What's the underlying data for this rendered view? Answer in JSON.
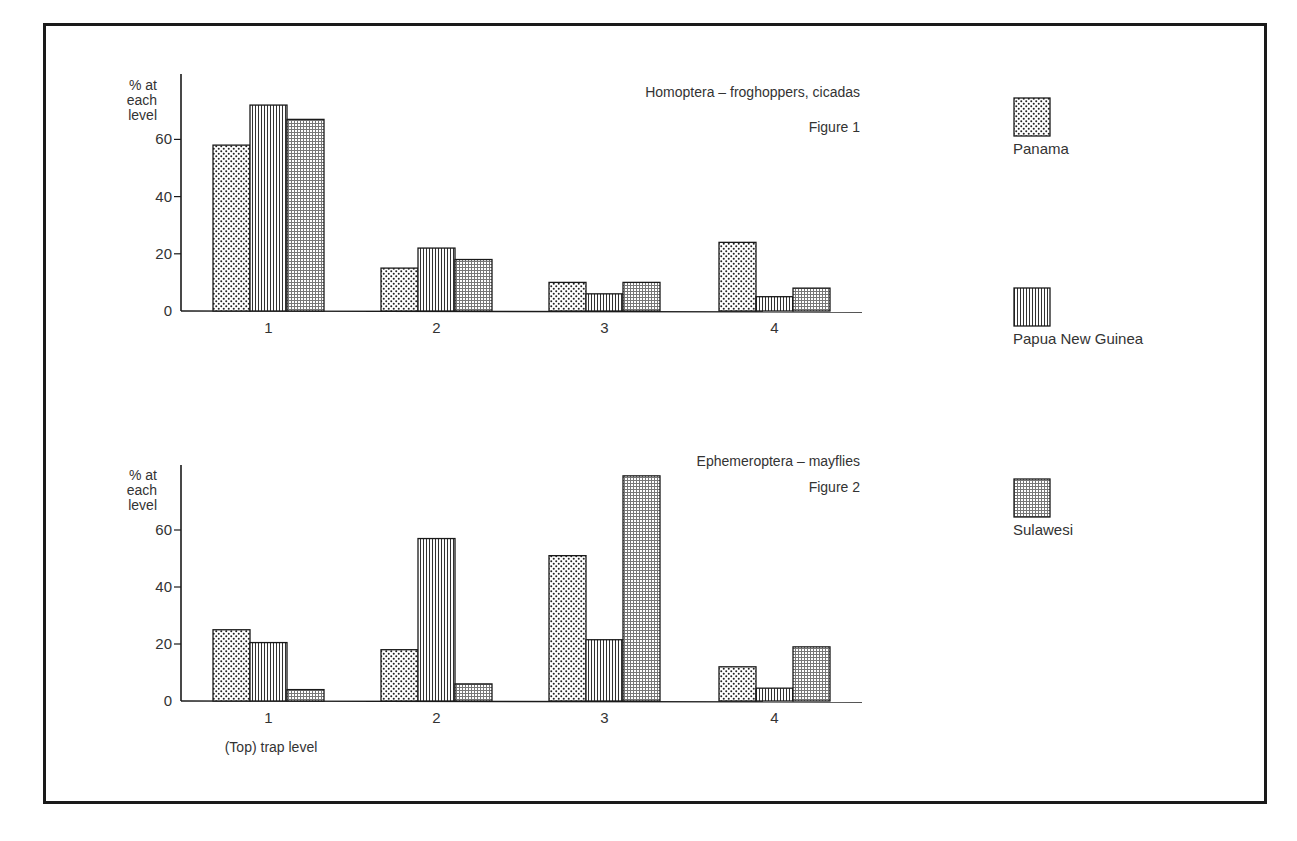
{
  "chart_data": [
    {
      "type": "bar",
      "title": "Homoptera – froghoppers, cicadas",
      "figure_label": "Figure 1",
      "ylabel": "% at each level",
      "xlabel": "",
      "categories": [
        "1",
        "2",
        "3",
        "4"
      ],
      "yticks": [
        0,
        20,
        40,
        60
      ],
      "ylim": [
        0,
        80
      ],
      "grid": false,
      "legend_position": "right",
      "series": [
        {
          "name": "Panama",
          "pattern": "dots",
          "values": [
            58,
            15,
            10,
            24
          ]
        },
        {
          "name": "Papua New Guinea",
          "pattern": "vertical-lines",
          "values": [
            72,
            22,
            6,
            5
          ]
        },
        {
          "name": "Sulawesi",
          "pattern": "fine-grid",
          "values": [
            67,
            18,
            10,
            8
          ]
        }
      ]
    },
    {
      "type": "bar",
      "title": "Ephemeroptera – mayflies",
      "figure_label": "Figure 2",
      "ylabel": "% at each level",
      "xlabel": "(Top) trap level",
      "categories": [
        "1",
        "2",
        "3",
        "4"
      ],
      "yticks": [
        0,
        20,
        40,
        60
      ],
      "ylim": [
        0,
        80
      ],
      "grid": false,
      "legend_position": "right",
      "series": [
        {
          "name": "Panama",
          "pattern": "dots",
          "values": [
            25,
            18,
            51,
            12
          ]
        },
        {
          "name": "Papua New Guinea",
          "pattern": "vertical-lines",
          "values": [
            20.5,
            57,
            21.5,
            4.5
          ]
        },
        {
          "name": "Sulawesi",
          "pattern": "fine-grid",
          "values": [
            4,
            6,
            79,
            19
          ]
        }
      ]
    }
  ],
  "legend": [
    {
      "name": "Panama",
      "pattern": "dots"
    },
    {
      "name": "Papua New Guinea",
      "pattern": "vertical-lines"
    },
    {
      "name": "Sulawesi",
      "pattern": "fine-grid"
    }
  ],
  "colors": {
    "ink": "#1a1a1a",
    "text": "#333333",
    "background": "#ffffff"
  }
}
